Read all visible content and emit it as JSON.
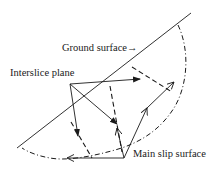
{
  "diagram": {
    "labels": {
      "ground_surface": "Ground surface",
      "ground_arrow": "→",
      "interslice_plane": "Interslice plane",
      "main_slip_surface": "Main slip surface"
    },
    "colors": {
      "line": "#1a1a1a",
      "background": "#ffffff"
    },
    "line_styles": {
      "ground_surface": "solid",
      "slip_surface": "dash-dot",
      "interslice_planes": "dashed"
    }
  }
}
